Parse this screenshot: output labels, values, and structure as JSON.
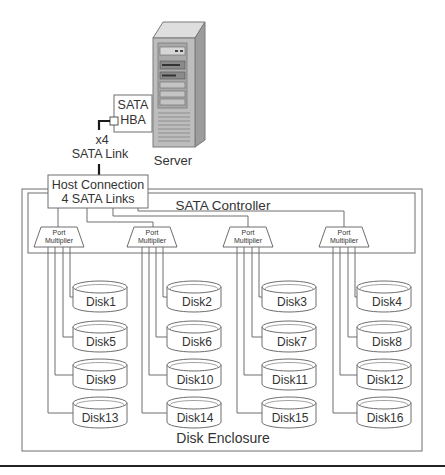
{
  "diagram": {
    "server": {
      "label": "Server"
    },
    "hba": {
      "line1": "SATA",
      "line2": "HBA"
    },
    "link": {
      "multiplier": "x4",
      "label": "SATA Link"
    },
    "host_connection": {
      "line1": "Host Connection",
      "line2": "4 SATA Links"
    },
    "controller": {
      "label": "SATA Controller"
    },
    "enclosure": {
      "label": "Disk Enclosure"
    },
    "port_multipliers": [
      {
        "line1": "Port",
        "line2": "Multiplier"
      },
      {
        "line1": "Port",
        "line2": "Multiplier"
      },
      {
        "line1": "Port",
        "line2": "Multiplier"
      },
      {
        "line1": "Port",
        "line2": "Multiplier"
      }
    ],
    "disks": [
      "Disk1",
      "Disk2",
      "Disk3",
      "Disk4",
      "Disk5",
      "Disk6",
      "Disk7",
      "Disk8",
      "Disk9",
      "Disk10",
      "Disk11",
      "Disk12",
      "Disk13",
      "Disk14",
      "Disk15",
      "Disk16"
    ],
    "colors": {
      "line": "#6e6e6e",
      "link": "#1a1a1a",
      "server_front": "#bdbdbd",
      "server_top": "#dedede",
      "server_side": "#9c9c9c",
      "text": "#333333"
    }
  }
}
